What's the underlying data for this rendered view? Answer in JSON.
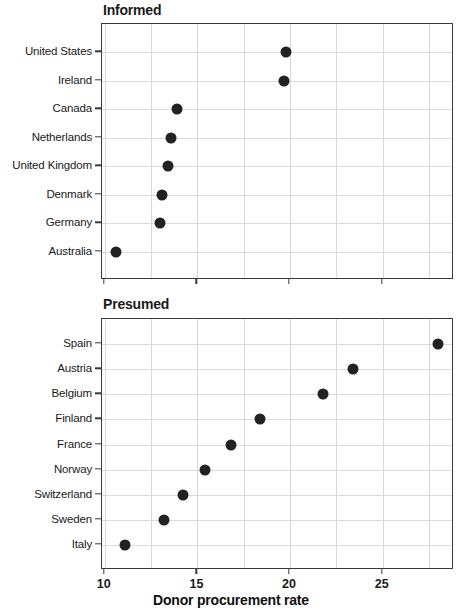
{
  "figure": {
    "xlabel": "Donor procurement rate"
  },
  "chart_data": [
    {
      "type": "scatter",
      "title": "Informed",
      "xlabel": "Donor procurement rate",
      "ylabel": "",
      "orientation": "horizontal-dotplot",
      "xlim": [
        9.85,
        28.85
      ],
      "xticks": [
        10,
        15,
        20,
        25
      ],
      "xtick_labels": [
        "10",
        "15",
        "20",
        "25"
      ],
      "gridlines_x": [
        10,
        12.5,
        15,
        17.5,
        20,
        22.5,
        25,
        27.5
      ],
      "grid": true,
      "legend": "none",
      "categories": [
        "United States",
        "Ireland",
        "Canada",
        "Netherlands",
        "United Kingdom",
        "Denmark",
        "Germany",
        "Australia"
      ],
      "values": [
        19.8,
        19.7,
        13.9,
        13.6,
        13.4,
        13.1,
        13.0,
        10.6
      ]
    },
    {
      "type": "scatter",
      "title": "Presumed",
      "xlabel": "Donor procurement rate",
      "ylabel": "",
      "orientation": "horizontal-dotplot",
      "xlim": [
        9.85,
        28.85
      ],
      "xticks": [
        10,
        15,
        20,
        25
      ],
      "xtick_labels": [
        "10",
        "15",
        "20",
        "25"
      ],
      "gridlines_x": [
        10,
        12.5,
        15,
        17.5,
        20,
        22.5,
        25,
        27.5
      ],
      "grid": true,
      "legend": "none",
      "categories": [
        "Spain",
        "Austria",
        "Belgium",
        "Finland",
        "France",
        "Norway",
        "Switzerland",
        "Sweden",
        "Italy"
      ],
      "values": [
        28.0,
        23.4,
        21.8,
        18.4,
        16.8,
        15.4,
        14.2,
        13.2,
        11.1
      ]
    }
  ],
  "colors": {
    "marker": "#222222",
    "axis": "#3a3a3a",
    "grid": "#d8d8d8",
    "text": "#1a1a1a",
    "background": "#ffffff"
  }
}
